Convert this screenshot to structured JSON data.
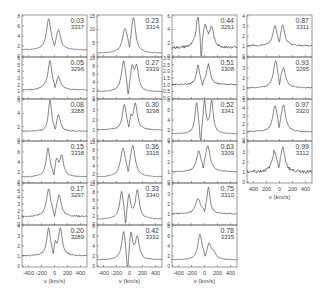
{
  "chart_data": {
    "type": "line",
    "title": "",
    "xlabel": "v (km/s)",
    "ylabel": "",
    "xlim": [
      -500,
      500
    ],
    "x_ticks": [
      -400,
      -200,
      0,
      200,
      400
    ],
    "x_tick_labels": [
      "-400",
      "-200",
      "0",
      "200",
      "400"
    ],
    "x_tick_labels_col4": [
      "400",
      "200",
      "0",
      "200",
      "400"
    ],
    "grid": false,
    "legend": null,
    "columns": [
      {
        "panels": [
          {
            "phase": "0.03",
            "id": "3337",
            "ymax": 8,
            "yticks": [
              0,
              2,
              4,
              6,
              8
            ],
            "base": 1.2,
            "peaks": [
              {
                "v": -90,
                "h": 7.3,
                "w": 40
              },
              {
                "v": 60,
                "h": 5.0,
                "w": 40
              }
            ],
            "dip": {
              "v": 0,
              "depth": 0.9,
              "w": 15
            },
            "noise": 0.05
          },
          {
            "phase": "0.05",
            "id": "3296",
            "ymax": 6,
            "yticks": [
              0,
              1,
              2,
              3,
              4,
              5,
              6
            ],
            "base": 1.2,
            "peaks": [
              {
                "v": -70,
                "h": 5.4,
                "w": 35
              },
              {
                "v": -140,
                "h": 1.5,
                "w": 60
              },
              {
                "v": 60,
                "h": 3.0,
                "w": 40
              }
            ],
            "dip": {
              "v": 10,
              "depth": 1.0,
              "w": 15
            },
            "noise": 0.08
          },
          {
            "phase": "0.08",
            "id": "3288",
            "ymax": 6,
            "yticks": [
              0,
              2,
              4,
              6
            ],
            "base": 1.3,
            "peaks": [
              {
                "v": -70,
                "h": 6.0,
                "w": 30
              },
              {
                "v": 60,
                "h": 3.6,
                "w": 35
              },
              {
                "v": -150,
                "h": 1.2,
                "w": 70
              }
            ],
            "dip": {
              "v": 10,
              "depth": 1.1,
              "w": 12
            },
            "noise": 0.1
          },
          {
            "phase": "0.15",
            "id": "3338",
            "ymax": 8,
            "yticks": [
              0,
              2,
              4,
              6,
              8
            ],
            "base": 1.0,
            "peaks": [
              {
                "v": -100,
                "h": 6.6,
                "w": 35
              },
              {
                "v": 30,
                "h": 4.2,
                "w": 30
              },
              {
                "v": 110,
                "h": 5.0,
                "w": 35
              }
            ],
            "dip": {
              "v": -10,
              "depth": 1.2,
              "w": 15
            },
            "noise": 0.08
          },
          {
            "phase": "0.17",
            "id": "3297",
            "ymax": 6,
            "yticks": [
              0,
              1,
              2,
              3,
              4,
              5,
              6
            ],
            "base": 1.1,
            "peaks": [
              {
                "v": -90,
                "h": 5.1,
                "w": 40
              },
              {
                "v": 70,
                "h": 4.2,
                "w": 40
              }
            ],
            "dip": {
              "v": 0,
              "depth": 1.3,
              "w": 15
            },
            "noise": 0.1
          },
          {
            "phase": "0.20",
            "id": "3289",
            "ymax": 4,
            "yticks": [
              0,
              1,
              2,
              3,
              4
            ],
            "base": 1.0,
            "peaks": [
              {
                "v": -90,
                "h": 3.7,
                "w": 35
              },
              {
                "v": 90,
                "h": 3.7,
                "w": 35
              },
              {
                "v": 10,
                "h": 2.0,
                "w": 20
              }
            ],
            "dip": {
              "v": -20,
              "depth": 1.1,
              "w": 12
            },
            "noise": 0.06
          }
        ]
      },
      {
        "panels": [
          {
            "phase": "0.23",
            "id": "3314",
            "ymax": 15,
            "yticks": [
              0,
              5,
              10,
              15
            ],
            "base": 1.0,
            "peaks": [
              {
                "v": -70,
                "h": 9.5,
                "w": 45
              },
              {
                "v": 60,
                "h": 14.0,
                "w": 40
              }
            ],
            "dip": {
              "v": 0,
              "depth": 1.0,
              "w": 15
            },
            "noise": 0.1
          },
          {
            "phase": "0.27",
            "id": "3339",
            "ymax": 10,
            "yticks": [
              0,
              2,
              4,
              6,
              8,
              10
            ],
            "base": 1.5,
            "peaks": [
              {
                "v": -90,
                "h": 9.2,
                "w": 40
              },
              {
                "v": 40,
                "h": 7.0,
                "w": 30
              },
              {
                "v": 110,
                "h": 7.4,
                "w": 35
              }
            ],
            "dip": {
              "v": -20,
              "depth": 1.8,
              "w": 15
            },
            "noise": 0.1
          },
          {
            "phase": "0.30",
            "id": "3298",
            "ymax": 4,
            "yticks": [
              0,
              1,
              2,
              3,
              4
            ],
            "base": 1.0,
            "peaks": [
              {
                "v": -80,
                "h": 3.5,
                "w": 35
              },
              {
                "v": 90,
                "h": 3.6,
                "w": 35
              },
              {
                "v": 20,
                "h": 2.0,
                "w": 18
              }
            ],
            "dip": {
              "v": -10,
              "depth": 1.0,
              "w": 12
            },
            "noise": 0.05
          },
          {
            "phase": "0.36",
            "id": "3315",
            "ymax": 10,
            "yticks": [
              0,
              2,
              4,
              6,
              8,
              10
            ],
            "base": 1.2,
            "peaks": [
              {
                "v": -100,
                "h": 8.0,
                "w": 45
              },
              {
                "v": 50,
                "h": 8.8,
                "w": 45
              }
            ],
            "dip": {
              "v": -20,
              "depth": 1.0,
              "w": 15
            },
            "noise": 0.08
          },
          {
            "phase": "0.33",
            "id": "3340",
            "ymax": 10,
            "yticks": [
              0,
              2,
              4,
              6,
              8,
              10
            ],
            "base": 1.2,
            "peaks": [
              {
                "v": -120,
                "h": 8.2,
                "w": 35
              },
              {
                "v": -10,
                "h": 7.0,
                "w": 30
              },
              {
                "v": 120,
                "h": 8.2,
                "w": 35
              }
            ],
            "dip": {
              "v": -60,
              "depth": 2.0,
              "w": 15
            },
            "noise": 0.08
          },
          {
            "phase": "0.42",
            "id": "3332",
            "ymax": 8,
            "yticks": [
              0,
              2,
              4,
              6,
              8
            ],
            "base": 1.2,
            "peaks": [
              {
                "v": -90,
                "h": 7.0,
                "w": 35
              },
              {
                "v": 20,
                "h": 6.6,
                "w": 30
              },
              {
                "v": 120,
                "h": 5.6,
                "w": 35
              }
            ],
            "dip": {
              "v": -30,
              "depth": 2.8,
              "w": 15
            },
            "noise": 0.08
          }
        ]
      },
      {
        "panels": [
          {
            "phase": "0.44",
            "id": "3291",
            "ymax": 6,
            "yticks": [
              0,
              2,
              4,
              6
            ],
            "base": 1.2,
            "peaks": [
              {
                "v": -100,
                "h": 5.9,
                "w": 35
              },
              {
                "v": 10,
                "h": 4.2,
                "w": 40
              },
              {
                "v": 110,
                "h": 4.0,
                "w": 35
              }
            ],
            "dip": {
              "v": -50,
              "depth": 3.4,
              "w": 10
            },
            "noise": 0.2
          },
          {
            "phase": "0.51",
            "id": "3308",
            "ymax": 3.0,
            "yticks": [
              0,
              0.5,
              1.0,
              1.5,
              2.0,
              2.5,
              3.0
            ],
            "ytick_labels": [
              "0.0",
              "0.5",
              "1.0",
              "1.5",
              "2.0",
              "2.5",
              "3.0"
            ],
            "base": 1.0,
            "peaks": [
              {
                "v": -100,
                "h": 2.4,
                "w": 30
              },
              {
                "v": 60,
                "h": 2.5,
                "w": 35
              }
            ],
            "dip": {
              "v": -30,
              "depth": 1.0,
              "w": 12
            },
            "noise": 0.06
          },
          {
            "phase": "0.52",
            "id": "3341",
            "ymax": 8,
            "yticks": [
              0,
              2,
              4,
              6,
              8
            ],
            "base": 1.2,
            "peaks": [
              {
                "v": -120,
                "h": 7.6,
                "w": 30
              },
              {
                "v": 0,
                "h": 7.8,
                "w": 25
              },
              {
                "v": 110,
                "h": 7.6,
                "w": 30
              }
            ],
            "dip": {
              "v": -60,
              "depth": 3.0,
              "w": 12
            },
            "noise": 0.05
          },
          {
            "phase": "0.63",
            "id": "3309",
            "ymax": 4,
            "yticks": [
              0,
              1,
              2,
              3,
              4
            ],
            "base": 1.0,
            "peaks": [
              {
                "v": -90,
                "h": 2.9,
                "w": 40
              },
              {
                "v": 50,
                "h": 3.5,
                "w": 45
              }
            ],
            "dip": {
              "v": -20,
              "depth": 1.0,
              "w": 12
            },
            "noise": 0.05
          },
          {
            "phase": "0.75",
            "id": "3310",
            "ymax": 4,
            "yticks": [
              0,
              1,
              2,
              3,
              4
            ],
            "base": 1.0,
            "peaks": [
              {
                "v": -100,
                "h": 2.5,
                "w": 45
              },
              {
                "v": 60,
                "h": 3.6,
                "w": 30
              }
            ],
            "dip": {
              "v": 0,
              "depth": 0.9,
              "w": 12
            },
            "noise": 0.06
          },
          {
            "phase": "0.78",
            "id": "3335",
            "ymax": 8,
            "yticks": [
              0,
              2,
              4,
              6,
              8
            ],
            "base": 1.2,
            "peaks": [
              {
                "v": -70,
                "h": 6.2,
                "w": 40
              },
              {
                "v": 70,
                "h": 4.0,
                "w": 35
              },
              {
                "v": 140,
                "h": 2.5,
                "w": 40
              }
            ],
            "dip": {
              "v": 10,
              "depth": 0.9,
              "w": 12
            },
            "noise": 0.04
          }
        ]
      },
      {
        "panels": [
          {
            "phase": "0.87",
            "id": "3311",
            "ymax": 4,
            "yticks": [
              0,
              1,
              2,
              3,
              4
            ],
            "base": 1.0,
            "peaks": [
              {
                "v": -70,
                "h": 2.9,
                "w": 40
              },
              {
                "v": 50,
                "h": 3.0,
                "w": 35
              }
            ],
            "dip": {
              "v": -5,
              "depth": 0.9,
              "w": 12
            },
            "noise": 0.08
          },
          {
            "phase": "0.93",
            "id": "3295",
            "ymax": 4,
            "yticks": [
              0,
              1,
              2,
              3,
              4
            ],
            "base": 1.0,
            "peaks": [
              {
                "v": -60,
                "h": 3.6,
                "w": 40
              },
              {
                "v": 60,
                "h": 2.8,
                "w": 40
              }
            ],
            "dip": {
              "v": 0,
              "depth": 1.0,
              "w": 12
            },
            "noise": 0.06
          },
          {
            "phase": "0.97",
            "id": "3320",
            "ymax": 5,
            "yticks": [
              0,
              1,
              2,
              3,
              4,
              5
            ],
            "base": 1.0,
            "peaks": [
              {
                "v": -70,
                "h": 4.1,
                "w": 40
              },
              {
                "v": 60,
                "h": 4.2,
                "w": 40
              }
            ],
            "dip": {
              "v": -5,
              "depth": 1.0,
              "w": 12
            },
            "noise": 0.08
          },
          {
            "phase": "0.99",
            "id": "3312",
            "ymax": 4,
            "yticks": [
              0,
              1,
              2,
              3,
              4
            ],
            "base": 1.0,
            "peaks": [
              {
                "v": -80,
                "h": 2.9,
                "w": 40
              },
              {
                "v": 50,
                "h": 3.3,
                "w": 40
              }
            ],
            "dip": {
              "v": -10,
              "depth": 0.9,
              "w": 10
            },
            "noise": 0.15
          }
        ]
      }
    ]
  }
}
